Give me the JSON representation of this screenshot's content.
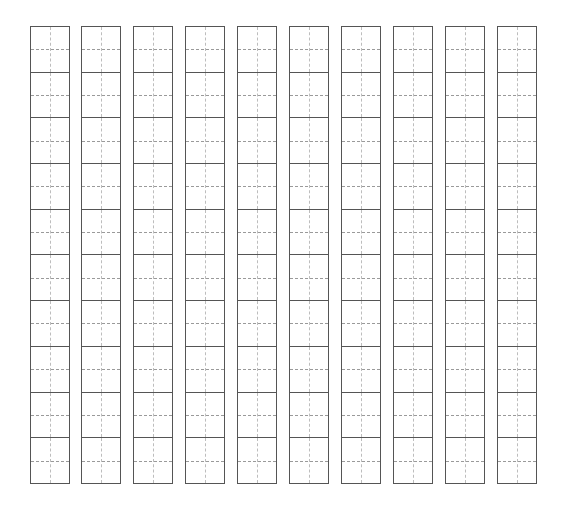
{
  "sheet": {
    "type": "tianzige-practice-grid",
    "columns": 10,
    "rows": 10,
    "column_left_positions": [
      30,
      81,
      133,
      185,
      237,
      289,
      341,
      393,
      445,
      497
    ],
    "border_color": "#555555",
    "guide_color": "#bdbdbd"
  }
}
